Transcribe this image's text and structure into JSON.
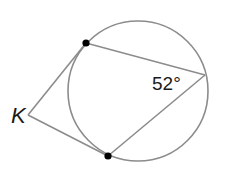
{
  "diagram": {
    "type": "geometry",
    "colors": {
      "stroke": "#8c8c8c",
      "point": "#000000",
      "text": "#1a1a1a"
    },
    "circle": {
      "cx": 138,
      "cy": 91,
      "r": 70
    },
    "points": {
      "K": {
        "x": 28,
        "y": 115
      },
      "A": {
        "x": 86,
        "y": 43
      },
      "B": {
        "x": 108,
        "y": 156
      },
      "C": {
        "x": 205,
        "y": 75
      }
    },
    "labels": {
      "vertex": "K",
      "angle": "52°"
    },
    "segments": [
      {
        "from": "K",
        "to": "A",
        "kind": "tangent"
      },
      {
        "from": "K",
        "to": "B",
        "kind": "tangent"
      },
      {
        "from": "A",
        "to": "C",
        "kind": "chord"
      },
      {
        "from": "B",
        "to": "C",
        "kind": "chord"
      }
    ]
  }
}
